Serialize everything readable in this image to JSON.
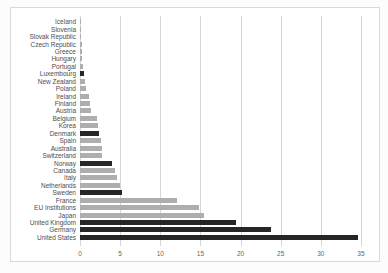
{
  "chart_data": {
    "type": "bar",
    "orientation": "horizontal",
    "title": "",
    "xlabel": "",
    "ylabel": "",
    "grid": "vertical",
    "xticks": [
      0,
      5,
      10,
      15,
      20,
      25,
      30,
      35
    ],
    "xlim": [
      0,
      36.5
    ],
    "categories": [
      "Iceland",
      "Slovenia",
      "Slovak Republic",
      "Czech Republic",
      "Greece",
      "Hungary",
      "Portugal",
      "Luxembourg",
      "New Zealand",
      "Poland",
      "Ireland",
      "Finland",
      "Austria",
      "Belgium",
      "Korea",
      "Denmark",
      "Spain",
      "Australia",
      "Switzerland",
      "Norway",
      "Canada",
      "Italy",
      "Netherlands",
      "Sweden",
      "France",
      "EU Institutions",
      "Japan",
      "United Kingdom",
      "Germany",
      "United States"
    ],
    "values": [
      0.05,
      0.07,
      0.12,
      0.2,
      0.25,
      0.3,
      0.35,
      0.5,
      0.6,
      0.75,
      1.1,
      1.25,
      1.4,
      2.1,
      2.3,
      2.4,
      2.6,
      2.7,
      2.8,
      4.0,
      4.3,
      4.6,
      5.0,
      5.2,
      12.1,
      14.8,
      15.4,
      19.4,
      23.8,
      34.6
    ],
    "highlighted": [
      false,
      false,
      false,
      false,
      false,
      false,
      false,
      true,
      false,
      false,
      false,
      false,
      false,
      false,
      false,
      true,
      false,
      false,
      false,
      true,
      false,
      false,
      false,
      true,
      false,
      false,
      false,
      true,
      true,
      true
    ],
    "colors": {
      "bar_default": "#aeaeae",
      "bar_highlight": "#262626",
      "gridline": "#d6d6d6",
      "frame_border": "#d9d9d9",
      "category_label": "#4d4d4d",
      "tick_label": "#666666",
      "background": "#ffffff"
    },
    "legend": null
  }
}
